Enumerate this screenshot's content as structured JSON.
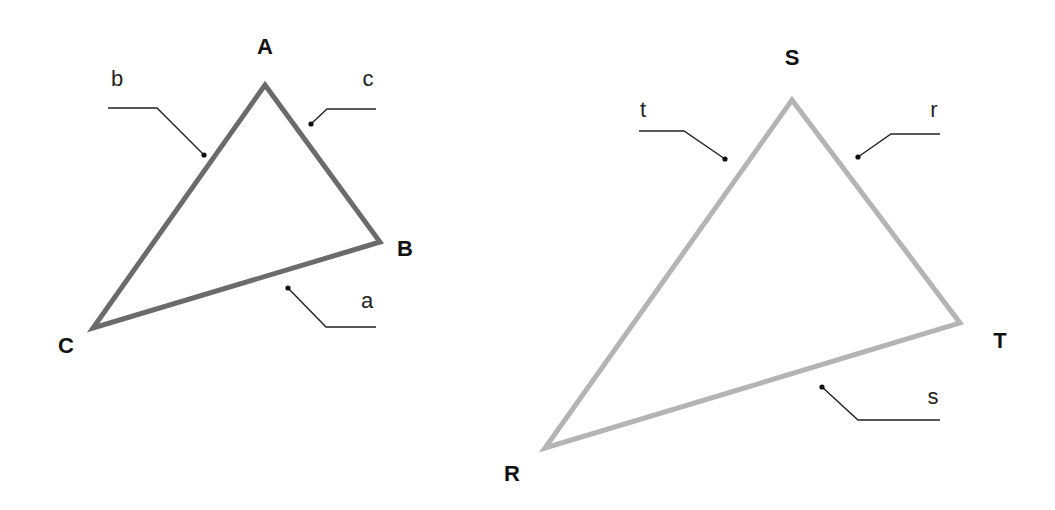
{
  "diagram": {
    "type": "two-triangles-labeled",
    "triangles": [
      {
        "name": "ABC",
        "stroke_color": "#6b6b6b",
        "vertices": [
          {
            "label": "A",
            "x": 265,
            "y": 85,
            "label_x": 265,
            "label_y": 54
          },
          {
            "label": "B",
            "x": 380,
            "y": 242,
            "label_x": 405,
            "label_y": 256
          },
          {
            "label": "C",
            "x": 93,
            "y": 328,
            "label_x": 66,
            "label_y": 353
          }
        ],
        "sides": [
          {
            "label": "b",
            "label_x": 117,
            "label_y": 86,
            "leader": "108,108 157,108 204,155",
            "dot_x": 204,
            "dot_y": 155
          },
          {
            "label": "c",
            "label_x": 368,
            "label_y": 86,
            "leader": "376,109 327,109 311,124",
            "dot_x": 311,
            "dot_y": 124
          },
          {
            "label": "a",
            "label_x": 367,
            "label_y": 308,
            "leader": "288,288 326,327 376,327",
            "dot_x": 288,
            "dot_y": 288
          }
        ]
      },
      {
        "name": "RST",
        "stroke_color": "#b4b4b4",
        "vertices": [
          {
            "label": "S",
            "x": 792,
            "y": 100,
            "label_x": 792,
            "label_y": 65
          },
          {
            "label": "T",
            "x": 960,
            "y": 323,
            "label_x": 1000,
            "label_y": 348
          },
          {
            "label": "R",
            "x": 545,
            "y": 448,
            "label_x": 512,
            "label_y": 481
          }
        ],
        "sides": [
          {
            "label": "t",
            "label_x": 643,
            "label_y": 117,
            "leader": "639,131 684,131 725,159",
            "dot_x": 725,
            "dot_y": 159
          },
          {
            "label": "r",
            "label_x": 934,
            "label_y": 117,
            "leader": "940,134 891,134 858,157",
            "dot_x": 858,
            "dot_y": 157
          },
          {
            "label": "s",
            "label_x": 933,
            "label_y": 404,
            "leader": "822,387 858,420 940,420",
            "dot_x": 822,
            "dot_y": 387
          }
        ]
      }
    ]
  }
}
